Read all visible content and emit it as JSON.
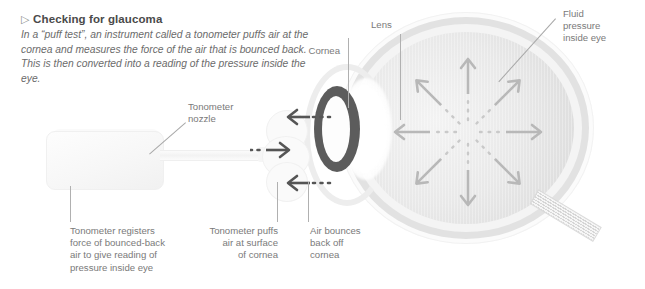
{
  "figure": {
    "title": "Checking for glaucoma",
    "title_bullet": "triangle-right-icon",
    "intro": "In a “puff test”, an instrument called a tonometer puffs air at the cornea and measures the force of the air that is bounced back. This is then converted into a reading of the pressure inside the eye."
  },
  "labels": {
    "cornea": "Cornea",
    "lens": "Lens",
    "fluid_pressure": "Fluid\npressure\ninside eye",
    "tonometer_nozzle": "Tonometer\nnozzle"
  },
  "captions": {
    "registers": "Tonometer registers\nforce of bounced-back\nair to give reading of\npressure inside eye",
    "puffs": "Tonometer puffs\nair at surface\nof cornea",
    "bounces": "Air bounces\nback off\ncornea"
  },
  "colors": {
    "background": "#ffffff",
    "text": "#6d6d6d",
    "title_text": "#4a4a4a",
    "sclera": "#e2e2e2",
    "vitreous": "#e9e9e9",
    "cornea_ring": "#5c5c5c",
    "lens": "#ffffff",
    "pressure_arrow": "#b8b8b8",
    "air_arrow": "#555555",
    "leader_line": "#b0b0b0"
  },
  "diagram": {
    "type": "anatomical-illustration",
    "pressure_arrow_count": 8,
    "pressure_arrow_directions": [
      "up",
      "up-right",
      "right",
      "down-right",
      "down",
      "down-left",
      "left",
      "up-left"
    ],
    "air_arrows": [
      {
        "name": "bounce-back-upper",
        "direction": "left"
      },
      {
        "name": "puff-out",
        "direction": "right"
      },
      {
        "name": "bounce-back-lower",
        "direction": "left"
      }
    ]
  }
}
